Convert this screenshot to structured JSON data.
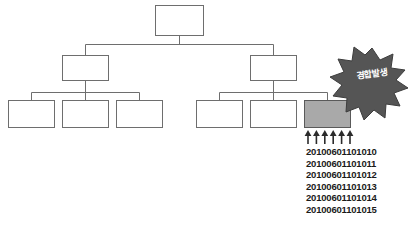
{
  "diagram": {
    "type": "hierarchy-tree",
    "title": "",
    "root": {
      "label": "",
      "name": "root-node"
    },
    "level2": [
      {
        "label": "",
        "name": "branch-node-left"
      },
      {
        "label": "",
        "name": "branch-node-right"
      }
    ],
    "leaves": [
      {
        "label": "",
        "name": "leaf-node-1",
        "highlighted": false
      },
      {
        "label": "",
        "name": "leaf-node-2",
        "highlighted": false
      },
      {
        "label": "",
        "name": "leaf-node-3",
        "highlighted": false
      },
      {
        "label": "",
        "name": "leaf-node-4",
        "highlighted": false
      },
      {
        "label": "",
        "name": "leaf-node-5",
        "highlighted": false
      },
      {
        "label": "",
        "name": "leaf-node-6",
        "highlighted": true
      }
    ],
    "colors": {
      "box_fill": "#ffffff",
      "box_stroke": "#6e6e6e",
      "highlight_fill": "#a9a9a9",
      "burst_fill": "#555555",
      "burst_text": "#ffffff",
      "arrow": "#2b2b2b",
      "background": "#ffffff"
    }
  },
  "burst": {
    "label": "경합발생",
    "icon": "starburst-icon",
    "points": 12
  },
  "arrows": {
    "count": 6,
    "direction": "up",
    "icon": "arrow-up-icon"
  },
  "id_list": [
    "20100601101010",
    "20100601101011",
    "20100601101012",
    "20100601101013",
    "20100601101014",
    "20100601101015"
  ]
}
